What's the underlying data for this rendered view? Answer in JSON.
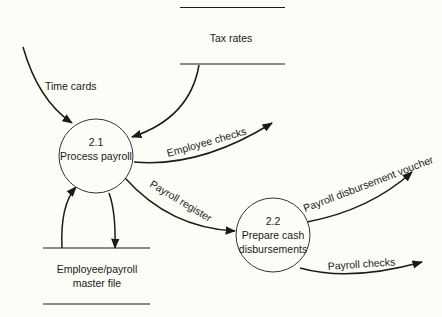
{
  "diagram": {
    "type": "data-flow-diagram",
    "processes": [
      {
        "id": "2.1",
        "number": "2.1",
        "label": "Process payroll"
      },
      {
        "id": "2.2",
        "number": "2.2",
        "label_line1": "Prepare cash",
        "label_line2": "disbursements"
      }
    ],
    "data_stores": [
      {
        "id": "tax-rates",
        "label": "Tax rates"
      },
      {
        "id": "employee-payroll-master",
        "label_line1": "Employee/payroll",
        "label_line2": "master file"
      }
    ],
    "flows": [
      {
        "from": "external",
        "to": "2.1",
        "label": "Time cards"
      },
      {
        "from": "tax-rates",
        "to": "2.1",
        "label": ""
      },
      {
        "from": "2.1",
        "to": "external",
        "label": "Employee checks"
      },
      {
        "from": "2.1",
        "to": "2.2",
        "label": "Payroll register"
      },
      {
        "from": "2.1",
        "to": "employee-payroll-master",
        "label": ""
      },
      {
        "from": "employee-payroll-master",
        "to": "2.1",
        "label": ""
      },
      {
        "from": "2.2",
        "to": "external",
        "label": "Payroll disbursement voucher"
      },
      {
        "from": "2.2",
        "to": "external",
        "label": "Payroll checks"
      }
    ]
  },
  "colors": {
    "background": "#fdfdf8",
    "ink": "#1a1a1a"
  }
}
